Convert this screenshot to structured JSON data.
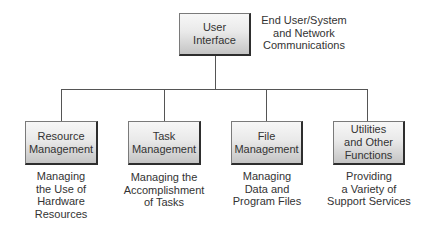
{
  "diagram": {
    "root": {
      "label_lines": [
        "User",
        "Interface"
      ],
      "caption_lines": [
        "End User/System",
        "and Network",
        "Communications"
      ]
    },
    "children": [
      {
        "label_lines": [
          "Resource",
          "Management"
        ],
        "caption_lines": [
          "Managing",
          "the Use of",
          "Hardware",
          "Resources"
        ]
      },
      {
        "label_lines": [
          "Task",
          "Management"
        ],
        "caption_lines": [
          "Managing the",
          "Accomplishment",
          "of Tasks"
        ]
      },
      {
        "label_lines": [
          "File",
          "Management"
        ],
        "caption_lines": [
          "Managing",
          "Data and",
          "Program Files"
        ]
      },
      {
        "label_lines": [
          "Utilities",
          "and Other",
          "Functions"
        ],
        "caption_lines": [
          "Providing",
          "a Variety of",
          "Support Services"
        ]
      }
    ],
    "colors": {
      "line": "#555555",
      "box_top": "#f7f7f7",
      "box_bottom": "#c4c4c4",
      "box_shadow_edge": "#2e2e2e",
      "text": "#333333"
    }
  }
}
